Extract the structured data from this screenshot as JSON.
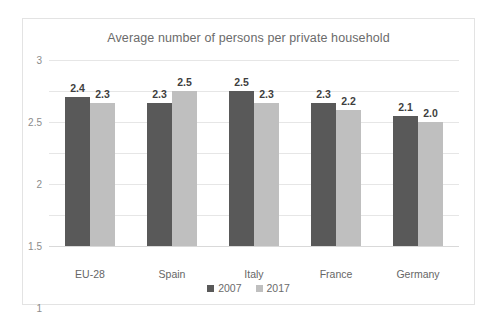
{
  "chart_data": {
    "type": "bar",
    "title": "Average number of persons per private household",
    "xlabel": "",
    "ylabel": "",
    "ylim": [
      0,
      3
    ],
    "yticks": [
      "0",
      "0.5",
      "1",
      "1.5",
      "2",
      "2.5",
      "3"
    ],
    "ytick_values": [
      0,
      0.5,
      1,
      1.5,
      2,
      2.5,
      3
    ],
    "grid": true,
    "legend_position": "bottom",
    "categories": [
      "EU-28",
      "Spain",
      "Italy",
      "France",
      "Germany"
    ],
    "series": [
      {
        "name": "2007",
        "color": "#595959",
        "values": [
          2.4,
          2.3,
          2.5,
          2.3,
          2.1
        ],
        "labels": [
          "2.4",
          "2.3",
          "2.5",
          "2.3",
          "2.1"
        ]
      },
      {
        "name": "2017",
        "color": "#bfbfbf",
        "values": [
          2.3,
          2.5,
          2.3,
          2.2,
          2.0
        ],
        "labels": [
          "2.3",
          "2.5",
          "2.3",
          "2.2",
          "2.0"
        ]
      }
    ]
  },
  "colors": {
    "series_2007": "#595959",
    "series_2017": "#bfbfbf",
    "title_text": "#6b6b6b",
    "tick_text": "#8c8c8c",
    "gridline": "#e6e6e6",
    "frame_border": "#e3e3e3",
    "background": "#ffffff"
  }
}
